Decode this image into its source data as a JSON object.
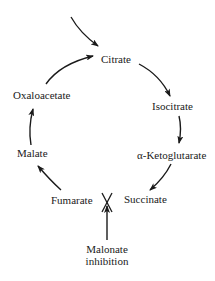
{
  "diagram": {
    "nodes": [
      {
        "id": "citrate",
        "label": "Citrate"
      },
      {
        "id": "isocitrate",
        "label": "Isocitrate"
      },
      {
        "id": "alpha_ketoglutarate",
        "label": "α-Ketoglutarate"
      },
      {
        "id": "succinate",
        "label": "Succinate"
      },
      {
        "id": "fumarate",
        "label": "Fumarate"
      },
      {
        "id": "malate",
        "label": "Malate"
      },
      {
        "id": "oxaloacetate",
        "label": "Oxaloacetate"
      }
    ],
    "inhibitor": {
      "line1": "Malonate",
      "line2": "inhibition",
      "blocked_step": "Succinate → Fumarate",
      "symbol": "X"
    },
    "edges": [
      {
        "from": "entry",
        "to": "citrate"
      },
      {
        "from": "oxaloacetate",
        "to": "citrate"
      },
      {
        "from": "citrate",
        "to": "isocitrate"
      },
      {
        "from": "isocitrate",
        "to": "alpha_ketoglutarate"
      },
      {
        "from": "alpha_ketoglutarate",
        "to": "succinate"
      },
      {
        "from": "succinate",
        "to": "fumarate",
        "blocked": true
      },
      {
        "from": "fumarate",
        "to": "malate"
      },
      {
        "from": "malate",
        "to": "oxaloacetate"
      }
    ]
  }
}
